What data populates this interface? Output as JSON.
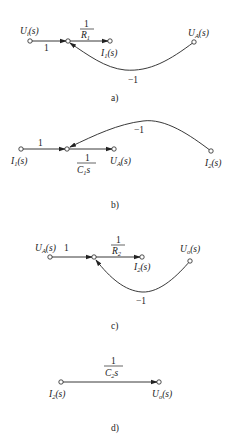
{
  "diagrams": [
    {
      "id": "a",
      "caption": "a)",
      "nodes": {
        "input": {
          "name": "U",
          "sub": "i",
          "arg": "(s)"
        },
        "output": {
          "name": "I",
          "sub": "1",
          "arg": "(s)"
        },
        "feedback": {
          "name": "U",
          "sub": "A",
          "arg": "(s)"
        }
      },
      "gains": {
        "forward1": "1",
        "forward2_num": "1",
        "forward2_den": "R",
        "forward2_den_sub": "1",
        "feedback": "−1"
      }
    },
    {
      "id": "b",
      "caption": "b)",
      "nodes": {
        "input": {
          "name": "I",
          "sub": "1",
          "arg": "(s)"
        },
        "output": {
          "name": "U",
          "sub": "A",
          "arg": "(s)"
        },
        "feedback": {
          "name": "I",
          "sub": "2",
          "arg": "(s)"
        }
      },
      "gains": {
        "forward1": "1",
        "forward2_num": "1",
        "forward2_den": "C",
        "forward2_den_sub": "1",
        "forward2_den_suffix": "s",
        "feedback": "−1"
      }
    },
    {
      "id": "c",
      "caption": "c)",
      "nodes": {
        "input": {
          "name": "U",
          "sub": "A",
          "arg": "(s)"
        },
        "output": {
          "name": "I",
          "sub": "2",
          "arg": "(s)"
        },
        "feedback": {
          "name": "U",
          "sub": "o",
          "arg": "(s)"
        }
      },
      "gains": {
        "forward1": "1",
        "forward2_num": "1",
        "forward2_den": "R",
        "forward2_den_sub": "2",
        "feedback": "−1"
      }
    },
    {
      "id": "d",
      "caption": "d)",
      "nodes": {
        "input": {
          "name": "I",
          "sub": "2",
          "arg": "(s)"
        },
        "output": {
          "name": "U",
          "sub": "o",
          "arg": "(s)"
        }
      },
      "gains": {
        "forward_num": "1",
        "forward_den": "C",
        "forward_den_sub": "2",
        "forward_den_suffix": "s"
      }
    }
  ]
}
